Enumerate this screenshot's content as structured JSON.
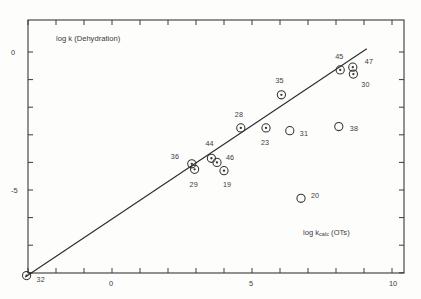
{
  "figure": {
    "background_color": "#fdfdfc",
    "ink_color": "#333333"
  },
  "axes": {
    "y_title": "log k  (Dehydration)",
    "x_title_main": "log k",
    "x_title_sub": "calc",
    "x_title_tail": " (OTs)",
    "x_ticks": [
      -3,
      -2,
      -1,
      0,
      1,
      2,
      3,
      4,
      5,
      6,
      7,
      8,
      9,
      10
    ],
    "x_tick_labels": [
      {
        "value": 0,
        "text": "0"
      },
      {
        "value": 5,
        "text": "5"
      },
      {
        "value": 10,
        "text": "10"
      }
    ],
    "y_ticks": [
      0,
      -1,
      -2,
      -3,
      -4,
      -5,
      -6,
      -7,
      -8
    ],
    "y_tick_labels": [
      {
        "value": 0,
        "text": "0"
      },
      {
        "value": -5,
        "text": "-5"
      }
    ],
    "x_range": [
      -3.4,
      10.5
    ],
    "y_range": [
      -8.4,
      0.85
    ],
    "grid": false
  },
  "chart_data": {
    "type": "scatter",
    "title": "",
    "subtitle": "",
    "xlabel": "log k_calc (OTs)",
    "ylabel": "log k (Dehydration)",
    "xlim": [
      -3.4,
      10.5
    ],
    "ylim": [
      -8.4,
      0.85
    ],
    "grid": false,
    "legend": "none",
    "marker_styles": {
      "on_line": "circle-with-center-dot",
      "deviating": "open-circle"
    },
    "fit_line": {
      "label": "correlation line",
      "x_start": -3.1,
      "y_start": -8.15,
      "x_end": 9.1,
      "y_end": 0.12
    },
    "points": [
      {
        "label": "32",
        "x": -3.05,
        "y": -8.1,
        "style": "dot",
        "label_dx": 14,
        "label_dy": 4
      },
      {
        "label": "36",
        "x": 2.85,
        "y": -4.05,
        "style": "dot",
        "label_dx": -17,
        "label_dy": -7
      },
      {
        "label": "29",
        "x": 2.95,
        "y": -4.25,
        "style": "dot",
        "label_dx": -1,
        "label_dy": 16
      },
      {
        "label": "44",
        "x": 3.55,
        "y": -3.85,
        "style": "dot",
        "label_dx": -2,
        "label_dy": -14
      },
      {
        "label": "46",
        "x": 3.75,
        "y": -4.0,
        "style": "dot",
        "label_dx": 13,
        "label_dy": -4
      },
      {
        "label": "19",
        "x": 4.0,
        "y": -4.3,
        "style": "dot",
        "label_dx": 3,
        "label_dy": 14
      },
      {
        "label": "28",
        "x": 4.6,
        "y": -2.75,
        "style": "dot",
        "label_dx": -2,
        "label_dy": -13
      },
      {
        "label": "23",
        "x": 5.5,
        "y": -2.75,
        "style": "dot",
        "label_dx": -1,
        "label_dy": 15
      },
      {
        "label": "35",
        "x": 6.05,
        "y": -1.55,
        "style": "dot",
        "label_dx": -2,
        "label_dy": -14
      },
      {
        "label": "31",
        "x": 6.35,
        "y": -2.85,
        "style": "open",
        "label_dx": 14,
        "label_dy": 3
      },
      {
        "label": "20",
        "x": 6.75,
        "y": -5.3,
        "style": "open",
        "label_dx": 14,
        "label_dy": -2
      },
      {
        "label": "38",
        "x": 8.1,
        "y": -2.7,
        "style": "open",
        "label_dx": 15,
        "label_dy": 2
      },
      {
        "label": "45",
        "x": 8.15,
        "y": -0.65,
        "style": "dot",
        "label_dx": -1,
        "label_dy": -13
      },
      {
        "label": "47",
        "x": 8.6,
        "y": -0.55,
        "style": "dot",
        "label_dx": 16,
        "label_dy": -5
      },
      {
        "label": "30",
        "x": 8.62,
        "y": -0.8,
        "style": "dot",
        "label_dx": 12,
        "label_dy": 11
      }
    ]
  }
}
